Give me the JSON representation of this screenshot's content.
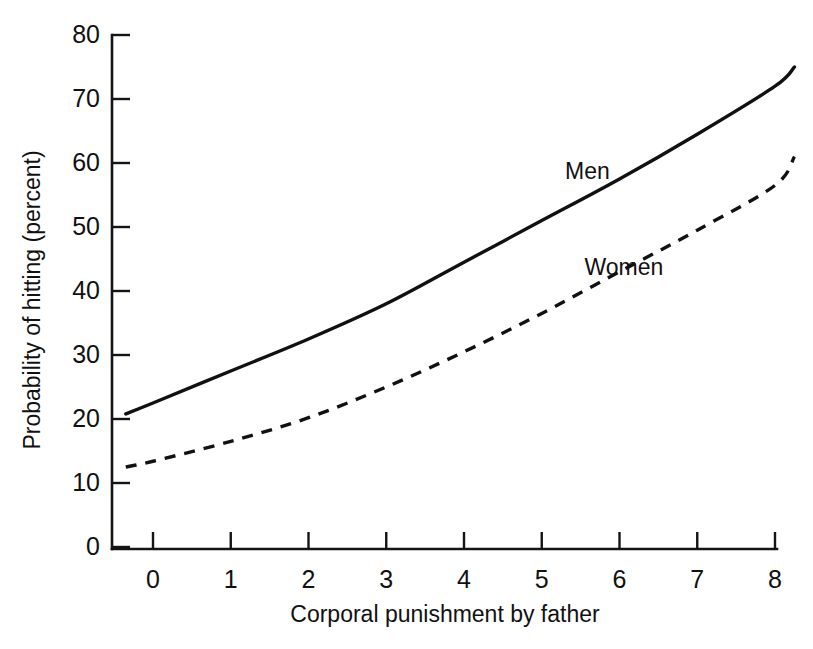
{
  "chart_data": {
    "type": "line",
    "title": "",
    "xlabel": "Corporal punishment by father",
    "ylabel": "Probability of hitting (percent)",
    "xlim": [
      -0.35,
      8.25
    ],
    "ylim": [
      0,
      80
    ],
    "xticks": [
      "0",
      "1",
      "2",
      "3",
      "4",
      "5",
      "6",
      "7",
      "8"
    ],
    "xtick_values": [
      0,
      1,
      2,
      3,
      4,
      5,
      6,
      7,
      8
    ],
    "yticks": [
      "0",
      "10",
      "20",
      "30",
      "40",
      "50",
      "60",
      "70",
      "80"
    ],
    "ytick_values": [
      0,
      10,
      20,
      30,
      40,
      50,
      60,
      70,
      80
    ],
    "grid": false,
    "legend_position": "inline-annotations",
    "x": [
      -0.35,
      0,
      1,
      2,
      3,
      4,
      5,
      6,
      7,
      8,
      8.25
    ],
    "series": [
      {
        "name": "Men",
        "style": "solid",
        "label_x": 5.3,
        "label_y": 57.5,
        "values": [
          20.8,
          22.5,
          27.5,
          32.5,
          38.0,
          44.5,
          51.0,
          57.5,
          64.5,
          72.0,
          75.0
        ]
      },
      {
        "name": "Women",
        "style": "dashed",
        "label_x": 5.55,
        "label_y": 42.5,
        "values": [
          12.5,
          13.4,
          16.5,
          20.2,
          25.0,
          30.5,
          36.5,
          43.0,
          49.5,
          56.5,
          61.0
        ]
      }
    ],
    "colors": {
      "ink": "#111111",
      "background": "#ffffff"
    }
  }
}
